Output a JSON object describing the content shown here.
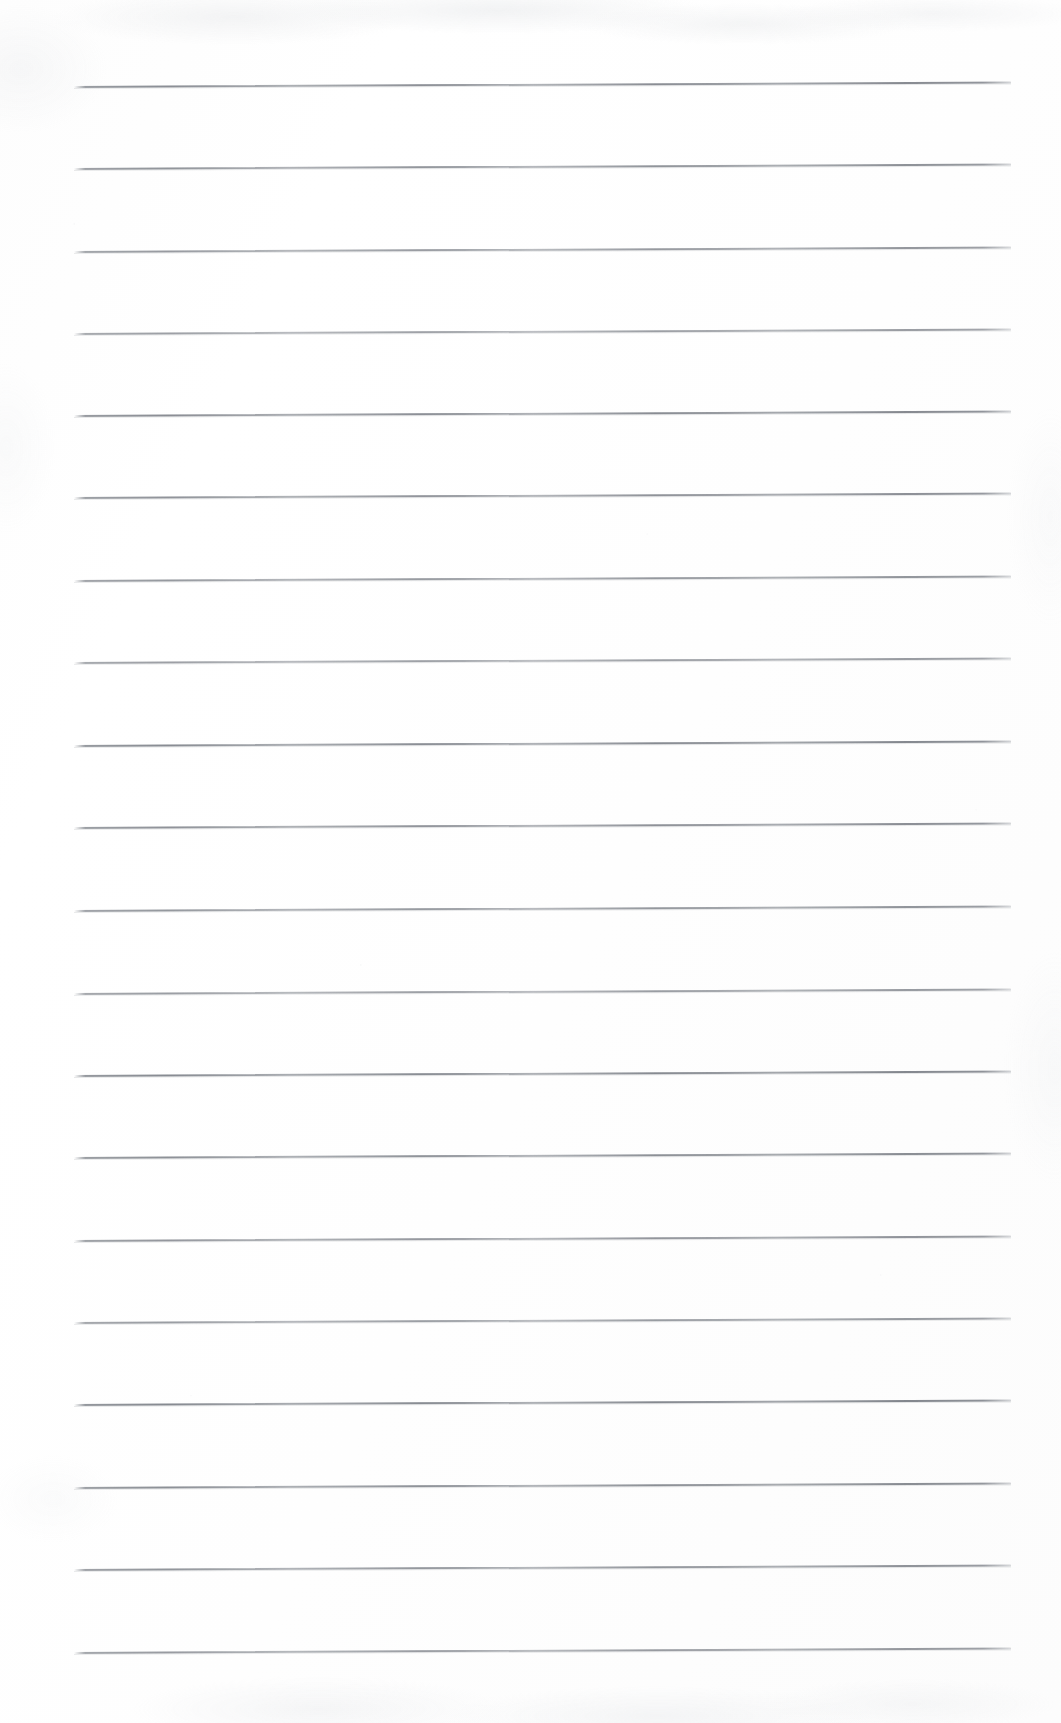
{
  "document": {
    "kind": "scanned-lined-paper",
    "title": "Blank lined notebook page",
    "page_width_px": 1061,
    "page_height_px": 1723,
    "background_color": "#fefefe",
    "has_text": false,
    "text_content": "",
    "handwriting_present": false,
    "margin_line_present": false,
    "header_present": false,
    "page_number": "",
    "notes": ""
  },
  "ruling": {
    "line_color": "#8b8f95",
    "line_count": 20,
    "line_thickness_px": 2,
    "first_line_y_px": 86,
    "line_spacing_px": 82.3,
    "line_left_x_px": 74,
    "line_right_x_px": 1011,
    "line_length_px": 937,
    "tilt_degrees": -0.28,
    "style": "wide-ruled-horizontal"
  },
  "scan": {
    "grain_color": "#cdd0d4",
    "edge_shadow_color": "#d4d7db",
    "top_mottling": true,
    "bottom_mottling": true,
    "left_edge_artifact": true,
    "right_edge_artifact": true
  },
  "lines": [
    {
      "index": 1,
      "y": 86,
      "label": "rule-line-1"
    },
    {
      "index": 2,
      "y": 168,
      "label": "rule-line-2"
    },
    {
      "index": 3,
      "y": 251,
      "label": "rule-line-3"
    },
    {
      "index": 4,
      "y": 333,
      "label": "rule-line-4"
    },
    {
      "index": 5,
      "y": 415,
      "label": "rule-line-5"
    },
    {
      "index": 6,
      "y": 497,
      "label": "rule-line-6"
    },
    {
      "index": 7,
      "y": 580,
      "label": "rule-line-7"
    },
    {
      "index": 8,
      "y": 662,
      "label": "rule-line-8"
    },
    {
      "index": 9,
      "y": 745,
      "label": "rule-line-9"
    },
    {
      "index": 10,
      "y": 827,
      "label": "rule-line-10"
    },
    {
      "index": 11,
      "y": 910,
      "label": "rule-line-11"
    },
    {
      "index": 12,
      "y": 993,
      "label": "rule-line-12"
    },
    {
      "index": 13,
      "y": 1075,
      "label": "rule-line-13"
    },
    {
      "index": 14,
      "y": 1157,
      "label": "rule-line-14"
    },
    {
      "index": 15,
      "y": 1240,
      "label": "rule-line-15"
    },
    {
      "index": 16,
      "y": 1322,
      "label": "rule-line-16"
    },
    {
      "index": 17,
      "y": 1404,
      "label": "rule-line-17"
    },
    {
      "index": 18,
      "y": 1487,
      "label": "rule-line-18"
    },
    {
      "index": 19,
      "y": 1569,
      "label": "rule-line-19"
    },
    {
      "index": 20,
      "y": 1652,
      "label": "rule-line-20"
    }
  ]
}
